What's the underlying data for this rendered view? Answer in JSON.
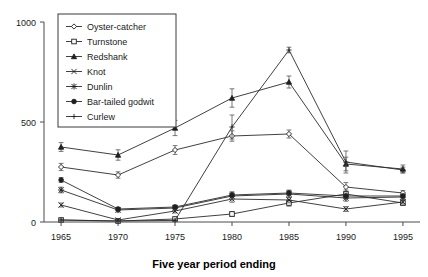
{
  "chart_data": {
    "type": "line",
    "title": "",
    "xlabel": "Five year period ending",
    "ylabel": "",
    "categories": [
      "1965",
      "1970",
      "1975",
      "1980",
      "1985",
      "1990",
      "1995"
    ],
    "x": [
      1965,
      1970,
      1975,
      1980,
      1985,
      1990,
      1995
    ],
    "xlim": [
      1963.5,
      1996.5
    ],
    "ylim": [
      0,
      1000
    ],
    "yticks": [
      0,
      500,
      1000
    ],
    "ytick_labels": [
      "0",
      "500",
      "1000"
    ],
    "grid": false,
    "legend_position": "top-left-inside",
    "error_bars": true,
    "series": [
      {
        "name": "Oyster-catcher",
        "marker": "diamond",
        "values": [
          275,
          235,
          360,
          430,
          440,
          175,
          145
        ],
        "errors": [
          18,
          16,
          22,
          26,
          20,
          22,
          12
        ]
      },
      {
        "name": "Turnstone",
        "marker": "square",
        "values": [
          10,
          5,
          15,
          40,
          95,
          140,
          95
        ],
        "errors": [
          6,
          5,
          8,
          12,
          16,
          20,
          12
        ]
      },
      {
        "name": "Redshank",
        "marker": "triangle",
        "values": [
          375,
          335,
          470,
          620,
          700,
          290,
          265
        ],
        "errors": [
          22,
          26,
          38,
          46,
          30,
          34,
          20
        ]
      },
      {
        "name": "Knot",
        "marker": "cross",
        "values": [
          85,
          10,
          55,
          115,
          110,
          65,
          100
        ],
        "errors": [
          10,
          6,
          10,
          16,
          14,
          12,
          10
        ]
      },
      {
        "name": "Dunlin",
        "marker": "star",
        "values": [
          160,
          60,
          70,
          130,
          140,
          120,
          125
        ],
        "errors": [
          14,
          10,
          12,
          18,
          18,
          16,
          12
        ]
      },
      {
        "name": "Bar-tailed godwit",
        "marker": "circle",
        "values": [
          210,
          65,
          75,
          135,
          145,
          130,
          130
        ],
        "errors": [
          12,
          8,
          10,
          16,
          14,
          14,
          10
        ]
      },
      {
        "name": "Curlew",
        "marker": "plus",
        "values": [
          10,
          5,
          8,
          475,
          860,
          300,
          260
        ],
        "errors": [
          5,
          4,
          6,
          60,
          14,
          55,
          14
        ]
      }
    ]
  },
  "legend": {
    "items": [
      {
        "label": "Oyster-catcher"
      },
      {
        "label": "Turnstone"
      },
      {
        "label": "Redshank"
      },
      {
        "label": "Knot"
      },
      {
        "label": "Dunlin"
      },
      {
        "label": "Bar-tailed godwit"
      },
      {
        "label": "Curlew"
      }
    ]
  },
  "axes": {
    "y_labels": [
      "1000",
      "500",
      "0"
    ],
    "x_labels": [
      "1965",
      "1970",
      "1975",
      "1980",
      "1985",
      "1990",
      "1995"
    ],
    "x_title": "Five year period ending"
  }
}
